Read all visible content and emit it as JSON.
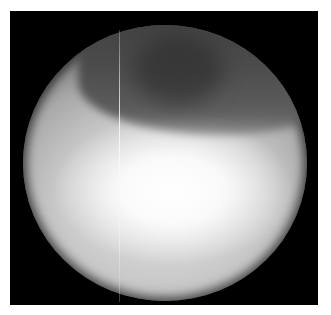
{
  "image": {
    "description": "Grayscale circular field-of-view image on black background",
    "colors": {
      "background": "#ffffff",
      "frame": "#000000",
      "highlight": "#ffffff",
      "midtone": "#b0b0b0",
      "shadow": "#404040"
    }
  }
}
